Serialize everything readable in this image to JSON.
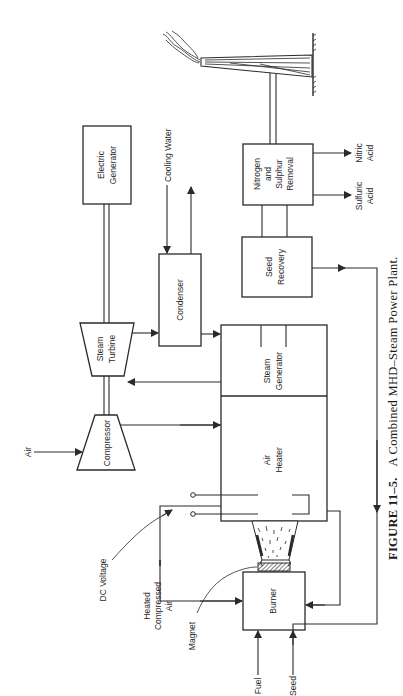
{
  "figure": {
    "caption_number": "FIGURE 11–5.",
    "caption_title": "A Combined MHD–Steam Power Plant.",
    "orientation": "rotated 90° counter-clockwise (text reads bottom-to-top)"
  },
  "components": {
    "electric_generator": [
      "Electric",
      "Generator"
    ],
    "steam_turbine": [
      "Steam",
      "Turbine"
    ],
    "compressor": "Compressor",
    "condenser": "Condenser",
    "steam_generator": [
      "Steam",
      "Generator"
    ],
    "air_heater": [
      "Air",
      "Heater"
    ],
    "seed_recovery": [
      "Seed",
      "Recovery"
    ],
    "nitrogen_sulphur_removal": [
      "Nitrogen",
      "and",
      "Sulphur",
      "Removal"
    ],
    "burner": "Burner",
    "stack": "smokestack-icon"
  },
  "labels": {
    "air": "Air",
    "cooling_water": "Cooling Water",
    "dc_voltage": "DC Voltage",
    "heated_compressed_air": [
      "Heated",
      "Compressed",
      "Air"
    ],
    "magnet": "Magnet",
    "fuel": "Fuel",
    "seed": "Seed",
    "nitric_acid": [
      "Nitric",
      "Acid"
    ],
    "sulfuric_acid": [
      "Sulfuric",
      "Acid"
    ]
  },
  "colors": {
    "ink": "#2a2a2a",
    "paper": "#ffffff"
  }
}
